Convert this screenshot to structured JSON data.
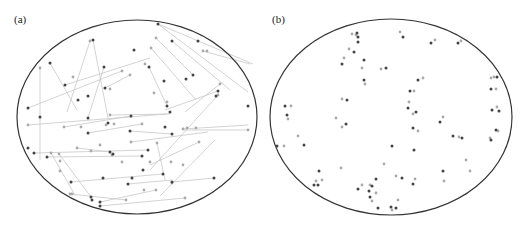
{
  "colors": {
    "ellipse_stroke": "#333333",
    "dark_node": "#444444",
    "light_node": "#aaaaaa",
    "edge": "#c8c8c8"
  },
  "panels": [
    {
      "label": "(a)",
      "ellipse": {
        "cx": 137,
        "cy": 117,
        "rx": 120,
        "ry": 97
      },
      "dark_nodes": [
        [
          158,
          24
        ],
        [
          93,
          40
        ],
        [
          172,
          41
        ],
        [
          134,
          50
        ],
        [
          50,
          63
        ],
        [
          104,
          67
        ],
        [
          149,
          67
        ],
        [
          193,
          75
        ],
        [
          65,
          85
        ],
        [
          186,
          79
        ],
        [
          164,
          81
        ],
        [
          216,
          96
        ],
        [
          105,
          88
        ],
        [
          88,
          96
        ],
        [
          218,
          91
        ],
        [
          78,
          100
        ],
        [
          167,
          106
        ],
        [
          170,
          112
        ],
        [
          28,
          108
        ],
        [
          40,
          117
        ],
        [
          88,
          118
        ],
        [
          108,
          123
        ],
        [
          131,
          116
        ],
        [
          165,
          127
        ],
        [
          88,
          133
        ],
        [
          130,
          131
        ],
        [
          172,
          134
        ],
        [
          28,
          148
        ],
        [
          34,
          153
        ],
        [
          110,
          152
        ],
        [
          148,
          150
        ],
        [
          113,
          154
        ],
        [
          142,
          156
        ],
        [
          47,
          157
        ],
        [
          143,
          170
        ],
        [
          132,
          178
        ],
        [
          163,
          174
        ],
        [
          172,
          182
        ],
        [
          214,
          178
        ],
        [
          128,
          184
        ],
        [
          103,
          178
        ],
        [
          71,
          182
        ],
        [
          91,
          197
        ],
        [
          92,
          200
        ],
        [
          100,
          202
        ],
        [
          100,
          206
        ],
        [
          198,
          41
        ],
        [
          248,
          106
        ]
      ],
      "light_nodes": [
        [
          90,
          41
        ],
        [
          156,
          38
        ],
        [
          151,
          48
        ],
        [
          203,
          51
        ],
        [
          207,
          51
        ],
        [
          40,
          68
        ],
        [
          73,
          77
        ],
        [
          122,
          71
        ],
        [
          130,
          75
        ],
        [
          145,
          64
        ],
        [
          154,
          93
        ],
        [
          220,
          84
        ],
        [
          218,
          95
        ],
        [
          110,
          89
        ],
        [
          167,
          102
        ],
        [
          28,
          125
        ],
        [
          64,
          127
        ],
        [
          81,
          127
        ],
        [
          106,
          125
        ],
        [
          114,
          124
        ],
        [
          142,
          124
        ],
        [
          110,
          115
        ],
        [
          183,
          129
        ],
        [
          187,
          128
        ],
        [
          196,
          128
        ],
        [
          248,
          130
        ],
        [
          77,
          148
        ],
        [
          100,
          145
        ],
        [
          157,
          143
        ],
        [
          51,
          153
        ],
        [
          59,
          154
        ],
        [
          91,
          151
        ],
        [
          131,
          142
        ],
        [
          199,
          142
        ],
        [
          60,
          171
        ],
        [
          171,
          162
        ],
        [
          183,
          165
        ],
        [
          112,
          155
        ],
        [
          150,
          162
        ],
        [
          122,
          162
        ],
        [
          70,
          194
        ],
        [
          72,
          194
        ],
        [
          126,
          200
        ],
        [
          144,
          190
        ],
        [
          156,
          190
        ],
        [
          185,
          198
        ],
        [
          172,
          183
        ],
        [
          60,
          161
        ]
      ],
      "edges": [
        [
          [
            158,
            24
          ],
          [
            248,
            92
          ]
        ],
        [
          [
            158,
            24
          ],
          [
            253,
            64
          ]
        ],
        [
          [
            93,
            40
          ],
          [
            108,
            118
          ]
        ],
        [
          [
            90,
            41
          ],
          [
            67,
            112
          ]
        ],
        [
          [
            50,
            63
          ],
          [
            77,
            110
          ]
        ],
        [
          [
            40,
            68
          ],
          [
            40,
            160
          ]
        ],
        [
          [
            28,
            108
          ],
          [
            122,
            71
          ]
        ],
        [
          [
            65,
            85
          ],
          [
            150,
            58
          ]
        ],
        [
          [
            105,
            88
          ],
          [
            130,
            75
          ]
        ],
        [
          [
            104,
            67
          ],
          [
            88,
            118
          ]
        ],
        [
          [
            149,
            67
          ],
          [
            167,
            106
          ]
        ],
        [
          [
            156,
            38
          ],
          [
            193,
            75
          ]
        ],
        [
          [
            151,
            48
          ],
          [
            196,
            100
          ]
        ],
        [
          [
            172,
            41
          ],
          [
            230,
            90
          ]
        ],
        [
          [
            203,
            51
          ],
          [
            250,
            64
          ]
        ],
        [
          [
            218,
            91
          ],
          [
            165,
            110
          ]
        ],
        [
          [
            218,
            95
          ],
          [
            150,
            170
          ]
        ],
        [
          [
            220,
            84
          ],
          [
            185,
            112
          ]
        ],
        [
          [
            28,
            125
          ],
          [
            167,
            114
          ]
        ],
        [
          [
            64,
            127
          ],
          [
            131,
            116
          ]
        ],
        [
          [
            88,
            133
          ],
          [
            142,
            124
          ]
        ],
        [
          [
            130,
            131
          ],
          [
            172,
            134
          ]
        ],
        [
          [
            110,
            115
          ],
          [
            170,
            114
          ]
        ],
        [
          [
            183,
            129
          ],
          [
            248,
            125
          ]
        ],
        [
          [
            248,
            130
          ],
          [
            183,
            130
          ]
        ],
        [
          [
            34,
            153
          ],
          [
            148,
            150
          ]
        ],
        [
          [
            47,
            157
          ],
          [
            142,
            156
          ]
        ],
        [
          [
            51,
            153
          ],
          [
            75,
            195
          ]
        ],
        [
          [
            59,
            154
          ],
          [
            91,
            197
          ]
        ],
        [
          [
            77,
            148
          ],
          [
            110,
            152
          ]
        ],
        [
          [
            131,
            142
          ],
          [
            208,
            132
          ]
        ],
        [
          [
            199,
            142
          ],
          [
            150,
            165
          ]
        ],
        [
          [
            157,
            143
          ],
          [
            165,
            180
          ]
        ],
        [
          [
            172,
            182
          ],
          [
            214,
            178
          ]
        ],
        [
          [
            128,
            184
          ],
          [
            172,
            180
          ]
        ],
        [
          [
            71,
            182
          ],
          [
            163,
            174
          ]
        ],
        [
          [
            100,
            202
          ],
          [
            156,
            190
          ]
        ],
        [
          [
            100,
            206
          ],
          [
            185,
            198
          ]
        ],
        [
          [
            70,
            194
          ],
          [
            126,
            200
          ]
        ],
        [
          [
            215,
            140
          ],
          [
            160,
            196
          ]
        ]
      ]
    },
    {
      "label": "(b)",
      "ellipse": {
        "cx": 391,
        "cy": 117,
        "rx": 121,
        "ry": 98
      },
      "dark_nodes": [
        [
          357,
          33
        ],
        [
          358,
          37
        ],
        [
          358,
          42
        ],
        [
          403,
          37
        ],
        [
          431,
          43
        ],
        [
          458,
          43
        ],
        [
          354,
          52
        ],
        [
          342,
          64
        ],
        [
          364,
          60
        ],
        [
          386,
          68
        ],
        [
          364,
          80
        ],
        [
          418,
          80
        ],
        [
          410,
          91
        ],
        [
          347,
          100
        ],
        [
          285,
          106
        ],
        [
          408,
          108
        ],
        [
          416,
          112
        ],
        [
          497,
          77
        ],
        [
          491,
          89
        ],
        [
          492,
          110
        ],
        [
          499,
          111
        ],
        [
          287,
          115
        ],
        [
          346,
          124
        ],
        [
          440,
          122
        ],
        [
          413,
          128
        ],
        [
          453,
          136
        ],
        [
          496,
          130
        ],
        [
          462,
          138
        ],
        [
          277,
          146
        ],
        [
          304,
          145
        ],
        [
          392,
          146
        ],
        [
          414,
          150
        ],
        [
          491,
          140
        ],
        [
          319,
          171
        ],
        [
          443,
          171
        ],
        [
          402,
          178
        ],
        [
          314,
          185
        ],
        [
          318,
          185
        ],
        [
          358,
          189
        ],
        [
          372,
          186
        ],
        [
          369,
          191
        ],
        [
          370,
          197
        ],
        [
          413,
          184
        ],
        [
          378,
          208
        ],
        [
          391,
          207
        ],
        [
          396,
          208
        ],
        [
          376,
          179
        ]
      ],
      "light_nodes": [
        [
          352,
          34
        ],
        [
          356,
          35
        ],
        [
          400,
          32
        ],
        [
          435,
          40
        ],
        [
          461,
          41
        ],
        [
          349,
          49
        ],
        [
          344,
          58
        ],
        [
          362,
          68
        ],
        [
          381,
          69
        ],
        [
          365,
          84
        ],
        [
          423,
          78
        ],
        [
          414,
          91
        ],
        [
          342,
          99
        ],
        [
          291,
          106
        ],
        [
          409,
          102
        ],
        [
          413,
          114
        ],
        [
          494,
          77
        ],
        [
          491,
          78
        ],
        [
          496,
          89
        ],
        [
          497,
          107
        ],
        [
          288,
          119
        ],
        [
          336,
          118
        ],
        [
          443,
          117
        ],
        [
          418,
          131
        ],
        [
          459,
          137
        ],
        [
          490,
          138
        ],
        [
          498,
          131
        ],
        [
          284,
          146
        ],
        [
          341,
          168
        ],
        [
          384,
          164
        ],
        [
          396,
          176
        ],
        [
          466,
          160
        ],
        [
          444,
          181
        ],
        [
          415,
          179
        ],
        [
          470,
          171
        ],
        [
          322,
          180
        ],
        [
          316,
          181
        ],
        [
          362,
          185
        ],
        [
          370,
          185
        ],
        [
          376,
          193
        ],
        [
          372,
          201
        ],
        [
          392,
          210
        ],
        [
          398,
          200
        ],
        [
          342,
          127
        ],
        [
          298,
          136
        ]
      ]
    }
  ]
}
